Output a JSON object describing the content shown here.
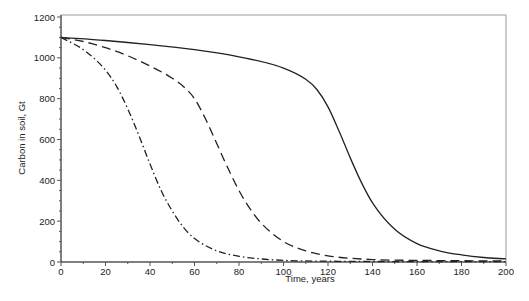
{
  "chart_data": {
    "type": "line",
    "title": "",
    "xlabel": "Time, years",
    "ylabel": "Carbon in soil, Gt",
    "xlim": [
      0,
      200
    ],
    "ylim": [
      0,
      1200
    ],
    "xticks": [
      0,
      20,
      40,
      60,
      80,
      100,
      120,
      140,
      160,
      180,
      200
    ],
    "yticks": [
      0,
      200,
      400,
      600,
      800,
      1000,
      1200
    ],
    "grid": false,
    "legend": null,
    "series": [
      {
        "name": "solid",
        "style": "solid",
        "x": [
          0,
          20,
          40,
          60,
          80,
          100,
          110,
          115,
          120,
          125,
          130,
          135,
          140,
          150,
          160,
          170,
          180,
          190,
          200
        ],
        "y": [
          1100,
          1085,
          1065,
          1040,
          1005,
          950,
          895,
          845,
          760,
          640,
          510,
          390,
          290,
          160,
          90,
          55,
          35,
          22,
          15
        ]
      },
      {
        "name": "dashed",
        "style": "dashed",
        "x": [
          0,
          10,
          20,
          30,
          40,
          50,
          55,
          60,
          65,
          70,
          75,
          80,
          85,
          90,
          100,
          110,
          120,
          140,
          160,
          200
        ],
        "y": [
          1100,
          1080,
          1050,
          1010,
          960,
          900,
          860,
          800,
          700,
          580,
          460,
          350,
          260,
          190,
          100,
          55,
          30,
          12,
          8,
          5
        ]
      },
      {
        "name": "dash-dot",
        "style": "dashdot",
        "x": [
          0,
          10,
          20,
          25,
          30,
          35,
          40,
          45,
          50,
          55,
          60,
          70,
          80,
          90,
          100,
          120,
          200
        ],
        "y": [
          1100,
          1040,
          940,
          860,
          750,
          620,
          480,
          350,
          250,
          170,
          115,
          55,
          28,
          15,
          8,
          4,
          2
        ]
      }
    ]
  }
}
